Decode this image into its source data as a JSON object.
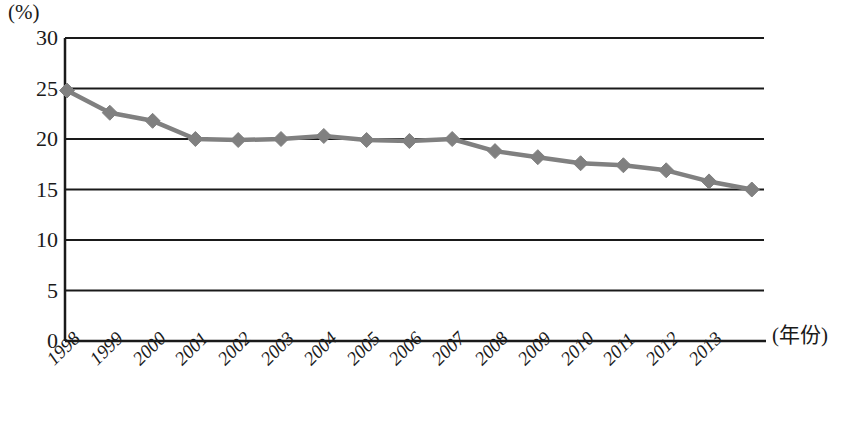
{
  "axes": {
    "y_unit_label": "(%)",
    "x_title": "(年份)",
    "y_ticks": [
      "30",
      "25",
      "20",
      "15",
      "10",
      "5",
      "0"
    ],
    "x_ticks": [
      "1998",
      "1999",
      "2000",
      "2001",
      "2002",
      "2003",
      "2004",
      "2005",
      "2006",
      "2007",
      "2008",
      "2009",
      "2010",
      "2011",
      "2012",
      "2013"
    ]
  },
  "style": {
    "series_color": "#808080",
    "axis_color": "#1a1a1a",
    "background": "#ffffff"
  },
  "chart_data": {
    "type": "line",
    "title": "",
    "xlabel": "(年份)",
    "ylabel": "(%)",
    "ylim": [
      0,
      30
    ],
    "ytick_step": 5,
    "grid": true,
    "grid_orientation": "horizontal",
    "legend": "none",
    "marker": "diamond",
    "categories": [
      "1998",
      "1999",
      "2000",
      "2001",
      "2002",
      "2003",
      "2004",
      "2005",
      "2006",
      "2007",
      "2008",
      "2009",
      "2010",
      "2011",
      "2012",
      "2013",
      "2014"
    ],
    "x": [
      1998,
      1999,
      2000,
      2001,
      2002,
      2003,
      2004,
      2005,
      2006,
      2007,
      2008,
      2009,
      2010,
      2011,
      2012,
      2013,
      2014
    ],
    "values": [
      24.8,
      22.6,
      21.8,
      20.0,
      19.9,
      20.0,
      20.3,
      19.9,
      19.8,
      20.0,
      18.8,
      18.2,
      17.6,
      17.4,
      16.9,
      15.8,
      15.0
    ]
  }
}
